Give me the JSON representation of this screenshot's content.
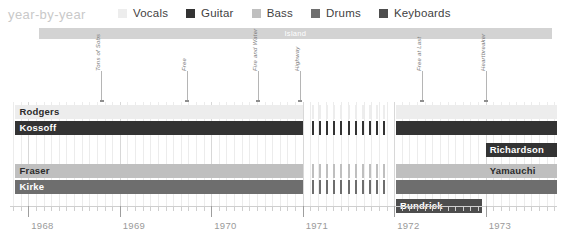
{
  "header": {
    "title": "year-by-year"
  },
  "legend": {
    "items": [
      {
        "label": "Vocals",
        "color": "#ededed"
      },
      {
        "label": "Guitar",
        "color": "#333333"
      },
      {
        "label": "Bass",
        "color": "#bfbfbf"
      },
      {
        "label": "Drums",
        "color": "#6e6e6e"
      },
      {
        "label": "Keyboards",
        "color": "#4d4d4d"
      }
    ]
  },
  "label_band": {
    "name": "Island",
    "color": "#d3d3d3",
    "start": 1968.12,
    "end": 1973.72
  },
  "annotations": [
    {
      "label": "Tons of Sobs",
      "year": 1968.8
    },
    {
      "label": "Free",
      "year": 1969.73
    },
    {
      "label": "Fire and Water",
      "year": 1970.51
    },
    {
      "label": "Highway",
      "year": 1970.97
    },
    {
      "label": "Free at Last",
      "year": 1972.3
    },
    {
      "label": "Heartbreaker",
      "year": 1973.0
    }
  ],
  "axis": {
    "min": 1967.8,
    "max": 1973.78,
    "year_ticks": [
      1968,
      1969,
      1970,
      1971,
      1972,
      1973
    ],
    "year_labels": [
      "1968",
      "1969",
      "1970",
      "1971",
      "1972",
      "1973"
    ],
    "minor_per_year": 12
  },
  "chart_data": {
    "type": "bar",
    "title": "year-by-year",
    "xlabel": "",
    "ylabel": "",
    "xlim": [
      1967.8,
      1973.78
    ],
    "grid": true,
    "legend_position": "top",
    "categories": [
      "Rodgers",
      "Kossoff",
      "Fraser",
      "Kirke",
      "Richardson",
      "Yamauchi",
      "Bundrick"
    ],
    "series": [
      {
        "name": "Rodgers",
        "role": "Vocals",
        "color": "#ededed",
        "text_color": "#2b2b2b",
        "row": 0,
        "segments": [
          {
            "start": 1967.86,
            "end": 1971.0,
            "style": "solid"
          },
          {
            "start": 1971.1,
            "end": 1971.96,
            "style": "dashed"
          },
          {
            "start": 1972.02,
            "end": 1973.78,
            "style": "solid"
          }
        ]
      },
      {
        "name": "Kossoff",
        "role": "Guitar",
        "color": "#333333",
        "text_color": "#ffffff",
        "row": 1,
        "segments": [
          {
            "start": 1967.86,
            "end": 1971.0,
            "style": "solid"
          },
          {
            "start": 1971.1,
            "end": 1971.96,
            "style": "dashed"
          },
          {
            "start": 1972.02,
            "end": 1973.78,
            "style": "solid"
          }
        ]
      },
      {
        "name": "Richardson",
        "role": "Guitar",
        "color": "#333333",
        "text_color": "#ffffff",
        "row": 2,
        "segments": [
          {
            "start": 1973.0,
            "end": 1973.78,
            "style": "solid"
          }
        ]
      },
      {
        "name": "Fraser",
        "role": "Bass",
        "color": "#bfbfbf",
        "text_color": "#2b2b2b",
        "row": 3,
        "segments": [
          {
            "start": 1967.86,
            "end": 1971.0,
            "style": "solid"
          },
          {
            "start": 1971.1,
            "end": 1971.96,
            "style": "dashed"
          },
          {
            "start": 1972.02,
            "end": 1973.0,
            "style": "solid"
          }
        ]
      },
      {
        "name": "Yamauchi",
        "role": "Bass",
        "color": "#bfbfbf",
        "text_color": "#2b2b2b",
        "row": 4,
        "segments": [
          {
            "start": 1973.0,
            "end": 1973.78,
            "style": "solid"
          }
        ]
      },
      {
        "name": "Kirke",
        "role": "Drums",
        "color": "#6e6e6e",
        "text_color": "#ffffff",
        "row": 5,
        "segments": [
          {
            "start": 1967.86,
            "end": 1971.0,
            "style": "solid"
          },
          {
            "start": 1971.1,
            "end": 1971.96,
            "style": "dashed"
          },
          {
            "start": 1972.02,
            "end": 1973.78,
            "style": "solid"
          }
        ]
      },
      {
        "name": "Bundrick",
        "role": "Keyboards",
        "color": "#4d4d4d",
        "text_color": "#ffffff",
        "row": 6,
        "segments": [
          {
            "start": 1972.02,
            "end": 1972.96,
            "style": "solid"
          }
        ]
      }
    ]
  }
}
